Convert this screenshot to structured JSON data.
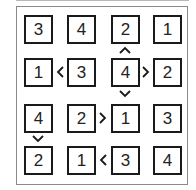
{
  "puzzle": {
    "type": "futoshiki",
    "size": 4,
    "grid": [
      [
        3,
        4,
        2,
        1
      ],
      [
        1,
        3,
        4,
        2
      ],
      [
        4,
        2,
        1,
        3
      ],
      [
        2,
        1,
        3,
        4
      ]
    ],
    "cells": {
      "r0c0": "3",
      "r0c1": "4",
      "r0c2": "2",
      "r0c3": "1",
      "r1c0": "1",
      "r1c1": "3",
      "r1c2": "4",
      "r1c3": "2",
      "r2c0": "4",
      "r2c1": "2",
      "r2c2": "1",
      "r2c3": "3",
      "r3c0": "2",
      "r3c1": "1",
      "r3c2": "3",
      "r3c3": "4"
    },
    "constraints": [
      {
        "between": [
          "r0c2",
          "r1c2"
        ],
        "symbol": "^",
        "icon": "up-chevron"
      },
      {
        "between": [
          "r1c0",
          "r1c1"
        ],
        "symbol": "<",
        "icon": "left-chevron"
      },
      {
        "between": [
          "r1c2",
          "r1c3"
        ],
        "symbol": ">",
        "icon": "right-chevron"
      },
      {
        "between": [
          "r1c2",
          "r2c2"
        ],
        "symbol": "v",
        "icon": "down-chevron"
      },
      {
        "between": [
          "r2c1",
          "r2c2"
        ],
        "symbol": ">",
        "icon": "right-chevron"
      },
      {
        "between": [
          "r2c0",
          "r3c0"
        ],
        "symbol": "v",
        "icon": "down-chevron"
      },
      {
        "between": [
          "r3c1",
          "r3c2"
        ],
        "symbol": "<",
        "icon": "left-chevron"
      }
    ]
  }
}
